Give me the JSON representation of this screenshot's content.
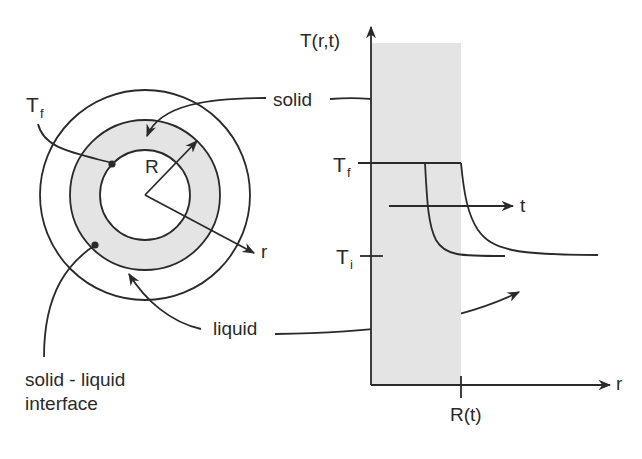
{
  "diagram": {
    "colors": {
      "line": "#2a2a2a",
      "solid_fill": "#e4e4e4",
      "background": "#ffffff"
    },
    "cross_section": {
      "labels": {
        "tf_main": "T",
        "tf_sub": "f",
        "radius": "R",
        "r_axis": "r",
        "solid": "solid",
        "liquid": "liquid",
        "interface_line1": "solid - liquid",
        "interface_line2": "interface"
      },
      "regions": [
        {
          "name": "inner-core",
          "fill": "none"
        },
        {
          "name": "solid-annulus",
          "fill": "#e4e4e4"
        },
        {
          "name": "liquid-annulus",
          "fill": "none"
        }
      ]
    },
    "plot": {
      "y_axis_label": "T(r,t)",
      "x_axis_label": "r",
      "time_arrow_label": "t",
      "y_ticks": [
        {
          "main": "T",
          "sub": "f",
          "meaning": "freezing temperature"
        },
        {
          "main": "T",
          "sub": "i",
          "meaning": "initial temperature"
        }
      ],
      "x_ticks": [
        {
          "label": "R(t)",
          "meaning": "interface position"
        }
      ],
      "curves": [
        {
          "name": "profile-earlier-time",
          "description": "T = Tf up to front, then decays to Ti"
        },
        {
          "name": "profile-later-time",
          "description": "front moved outward, decays to Ti"
        }
      ],
      "shaded_region": "solid"
    }
  }
}
